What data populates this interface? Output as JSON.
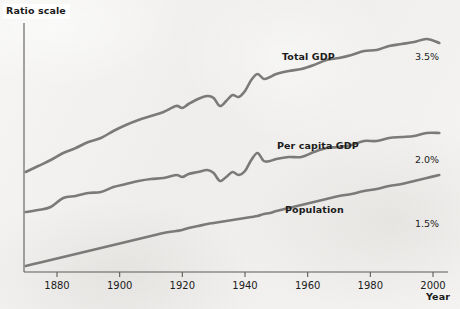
{
  "figure": {
    "background_color": "#f2f1ef",
    "line_color": "#7c7a78",
    "axis_color": "#5d5b58",
    "text_color": "#1b1b1b"
  },
  "annotations": {
    "ratio_scale": "Ratio scale",
    "year_axis": "Year"
  },
  "chart_data": {
    "type": "line",
    "title": "",
    "subtitle": "",
    "xlabel": "Year",
    "ylabel": "Ratio scale",
    "grid": false,
    "legend_position": "inline-right",
    "y_axis_note": "Ratio scale",
    "xlim": [
      1869,
      2005
    ],
    "xticks": [
      1880,
      1900,
      1920,
      1940,
      1960,
      1980,
      2000
    ],
    "xticklabels": [
      "1880",
      "1900",
      "1920",
      "1940",
      "1960",
      "1980",
      "2000"
    ],
    "yticks": [],
    "yticklabels": [],
    "annotations": [
      {
        "text": "Total GDP",
        "series": "Total GDP",
        "x": 1957,
        "bold": true
      },
      {
        "text": "3.5%",
        "series": "Total GDP",
        "x": 2003,
        "bold": false
      },
      {
        "text": "Per capita GDP",
        "series": "Per capita GDP",
        "x": 1955,
        "bold": true
      },
      {
        "text": "2.0%",
        "series": "Per capita GDP",
        "x": 2003,
        "bold": false
      },
      {
        "text": "Population",
        "series": "Population",
        "x": 1958,
        "bold": true
      },
      {
        "text": "1.5%",
        "series": "Population",
        "x": 2003,
        "bold": false
      }
    ],
    "growth_rates": {
      "Total GDP": "3.5%",
      "Per capita GDP": "2.0%",
      "Population": "1.5%"
    },
    "series": [
      {
        "name": "Total GDP",
        "annual_growth": "3.5%",
        "x": [
          1870,
          1874,
          1878,
          1882,
          1886,
          1890,
          1894,
          1898,
          1902,
          1906,
          1910,
          1914,
          1918,
          1920,
          1922,
          1925,
          1928,
          1930,
          1932,
          1934,
          1936,
          1938,
          1940,
          1942,
          1944,
          1946,
          1948,
          1950,
          1954,
          1958,
          1962,
          1966,
          1970,
          1974,
          1978,
          1982,
          1986,
          1990,
          1994,
          1998,
          2002
        ],
        "y": [
          172,
          166,
          160,
          153,
          148,
          142,
          138,
          131,
          125,
          120,
          116,
          112,
          106,
          108,
          104,
          99,
          96,
          98,
          106,
          101,
          95,
          97,
          91,
          80,
          74,
          79,
          77,
          74,
          71,
          69,
          65,
          60,
          58,
          55,
          51,
          50,
          46,
          44,
          42,
          39,
          43
        ]
      },
      {
        "name": "Per capita GDP",
        "annual_growth": "2.0%",
        "x": [
          1870,
          1874,
          1878,
          1882,
          1886,
          1890,
          1894,
          1898,
          1902,
          1906,
          1910,
          1914,
          1918,
          1920,
          1922,
          1925,
          1928,
          1930,
          1932,
          1934,
          1936,
          1938,
          1940,
          1942,
          1944,
          1946,
          1948,
          1950,
          1954,
          1958,
          1962,
          1966,
          1970,
          1974,
          1978,
          1982,
          1986,
          1990,
          1994,
          1998,
          2002
        ],
        "y": [
          212,
          210,
          207,
          198,
          196,
          193,
          192,
          187,
          184,
          181,
          179,
          178,
          175,
          177,
          174,
          172,
          170,
          173,
          181,
          177,
          172,
          175,
          171,
          160,
          153,
          161,
          161,
          159,
          157,
          157,
          152,
          148,
          147,
          145,
          141,
          141,
          138,
          137,
          136,
          133,
          133
        ]
      },
      {
        "name": "Population",
        "annual_growth": "1.5%",
        "x": [
          1870,
          1874,
          1878,
          1882,
          1886,
          1890,
          1894,
          1898,
          1902,
          1906,
          1910,
          1914,
          1918,
          1920,
          1922,
          1925,
          1928,
          1930,
          1932,
          1934,
          1936,
          1938,
          1940,
          1942,
          1944,
          1946,
          1948,
          1950,
          1954,
          1958,
          1962,
          1966,
          1970,
          1974,
          1978,
          1982,
          1986,
          1990,
          1994,
          1998,
          2002
        ],
        "y": [
          266,
          263,
          260,
          257,
          254,
          251,
          248,
          245,
          242,
          239,
          236,
          233,
          231,
          230,
          228,
          226,
          224,
          223,
          222,
          221,
          220,
          219,
          218,
          217,
          216,
          214,
          213,
          211,
          208,
          205,
          202,
          199,
          196,
          194,
          191,
          189,
          186,
          184,
          181,
          178,
          175
        ]
      }
    ]
  },
  "geometry": {
    "axis_x": 24,
    "axis_y_top": 23,
    "axis_y_bottom": 272,
    "axis_x_right": 448,
    "x_of_1880": 57,
    "x_of_2000": 433,
    "px_per_20yr": 62.7
  }
}
